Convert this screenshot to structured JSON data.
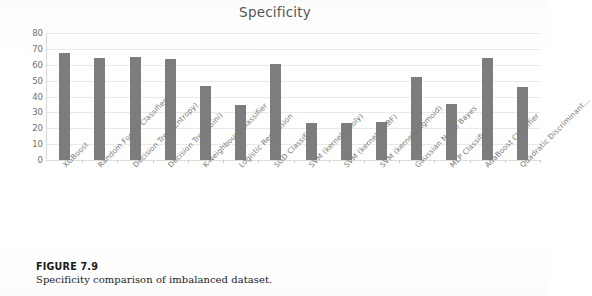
{
  "figure": {
    "number": "FIGURE 7.9",
    "caption": "Specificity comparison of imbalanced dataset."
  },
  "chart_data": {
    "type": "bar",
    "title": "Specificity",
    "xlabel": "",
    "ylabel": "",
    "ylim": [
      0,
      80
    ],
    "yticks": [
      0,
      10,
      20,
      30,
      40,
      50,
      60,
      70,
      80
    ],
    "grid": true,
    "legend": false,
    "bar_color": "#7d7d7d",
    "categories": [
      "XGBoost",
      "Random Forest Classifier",
      "Decision Tree (Entropy)",
      "Decision Tree (Gini)",
      "K-Neighbours Classifier",
      "Logistic Regression",
      "SGD Classifier",
      "SVM (kernel= poly)",
      "SVM (kernel= RBF)",
      "SVM (kernel=sigmoid)",
      "Gaussian Naive Bayes",
      "MLP Classifier",
      "AdaBoost Classifier",
      "Quadratic Discriminant..."
    ],
    "values": [
      67.5,
      64.5,
      65,
      63.5,
      46.5,
      34.5,
      60.5,
      23.5,
      23.5,
      24,
      52,
      35.5,
      64.5,
      46
    ]
  }
}
